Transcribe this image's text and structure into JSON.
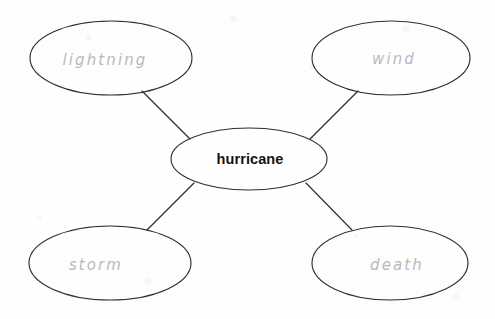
{
  "diagram": {
    "type": "word-web",
    "title_text": "hurricane",
    "center": {
      "label": "hurricane",
      "style": "printed",
      "cx": 249,
      "cy": 159,
      "rx": 78,
      "ry": 31
    },
    "nodes": [
      {
        "id": "lightning",
        "label": "lightning",
        "style": "handwritten",
        "position": "top-left",
        "cx": 111,
        "cy": 58,
        "rx": 81,
        "ry": 37
      },
      {
        "id": "wind",
        "label": "wind",
        "style": "handwritten",
        "position": "top-right",
        "cx": 391,
        "cy": 58,
        "rx": 79,
        "ry": 37
      },
      {
        "id": "storm",
        "label": "storm",
        "style": "handwritten",
        "position": "bottom-left",
        "cx": 110,
        "cy": 263,
        "rx": 81,
        "ry": 37
      },
      {
        "id": "death",
        "label": "death",
        "style": "handwritten",
        "position": "bottom-right",
        "cx": 390,
        "cy": 263,
        "rx": 78,
        "ry": 37
      }
    ],
    "connectors": [
      {
        "id": "center-to-lightning",
        "from": "hurricane",
        "to": "lightning",
        "x1": 142,
        "y1": 91,
        "x2": 190,
        "y2": 139
      },
      {
        "id": "center-to-wind",
        "from": "hurricane",
        "to": "wind",
        "x1": 358,
        "y1": 91,
        "x2": 310,
        "y2": 139
      },
      {
        "id": "center-to-storm",
        "from": "hurricane",
        "to": "storm",
        "x1": 147,
        "y1": 230,
        "x2": 194,
        "y2": 183
      },
      {
        "id": "center-to-death",
        "from": "hurricane",
        "to": "death",
        "x1": 352,
        "y1": 230,
        "x2": 306,
        "y2": 183
      }
    ],
    "colors": {
      "stroke": "#2f2f33",
      "handwriting": "#b9b9bd",
      "printed_text": "#121214",
      "background": "#fefefe"
    }
  }
}
